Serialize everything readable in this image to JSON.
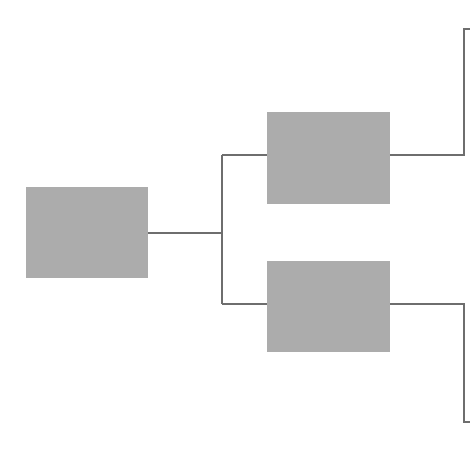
{
  "diagram": {
    "type": "tree",
    "orientation": "left-to-right",
    "colors": {
      "node_fill": "#acacac",
      "connector": "#6e6e6e",
      "background": "#ffffff"
    },
    "nodes": [
      {
        "id": "root",
        "label": ""
      },
      {
        "id": "child-top",
        "label": ""
      },
      {
        "id": "child-bottom",
        "label": ""
      }
    ],
    "edges": [
      {
        "from": "root",
        "to": "child-top"
      },
      {
        "from": "root",
        "to": "child-bottom"
      },
      {
        "from": "child-top",
        "to": "offscreen-top"
      },
      {
        "from": "child-bottom",
        "to": "offscreen-bottom"
      }
    ]
  }
}
